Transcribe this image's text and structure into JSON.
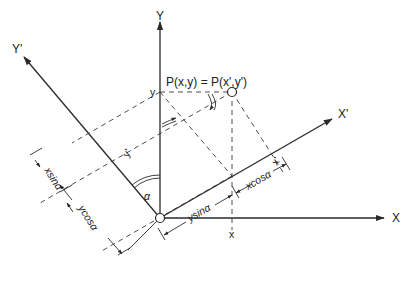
{
  "diagram": {
    "axes": {
      "x": "X",
      "y": "Y",
      "x_prime": "X'",
      "y_prime": "Y'"
    },
    "point_label": "P(x,y) = P(x',y')",
    "tick_labels": {
      "y_on_Y": "y",
      "x_on_X": "x",
      "x_prime_on_Xp": "x'",
      "y_prime_on_Yp": "y'"
    },
    "angle_label": "α",
    "dimensions": {
      "ysin": "ysinα",
      "xcos": "xcosα",
      "xsin": "xsinα",
      "ycos": "ycosα"
    },
    "colors": {
      "line": "#2a2a2a",
      "background": "#ffffff"
    }
  }
}
